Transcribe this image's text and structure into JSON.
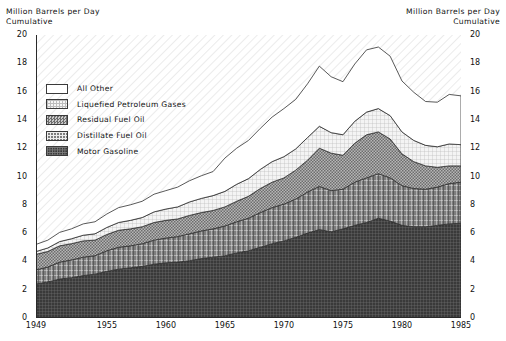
{
  "header": {
    "left": "Million Barrels per Day\nCumulative",
    "right": "Million Barrels per Day\nCumulative"
  },
  "legend": {
    "items": [
      {
        "label": "All Other",
        "swatch": "white",
        "color": "#ffffff"
      },
      {
        "label": "Liquefied Petroleum Gases",
        "swatch": "light-grid",
        "color": "#efefef"
      },
      {
        "label": "Residual Fuel Oil",
        "swatch": "medium-checker",
        "color": "#8f8f8f"
      },
      {
        "label": "Distillate Fuel Oil",
        "swatch": "dark-plaid",
        "color": "#5e5e5e"
      },
      {
        "label": "Motor Gasoline",
        "swatch": "darkest-plaid",
        "color": "#3c3c3c"
      }
    ]
  },
  "chart_data": {
    "type": "area",
    "stacked": true,
    "title": "Million Barrels per Day Cumulative",
    "xlabel": "",
    "ylabel": "Million Barrels per Day",
    "xlim": [
      1949,
      1985
    ],
    "ylim": [
      0,
      20
    ],
    "ytick_step": 2,
    "yticks": [
      0,
      2,
      4,
      6,
      8,
      10,
      12,
      14,
      16,
      18,
      20
    ],
    "xticks": [
      1949,
      1955,
      1960,
      1965,
      1970,
      1975,
      1980,
      1985
    ],
    "xtick_labels": [
      "1949",
      "1955",
      "1960",
      "1965",
      "1970",
      "1975",
      "1980",
      "1985"
    ],
    "minor_xticks": true,
    "grid": false,
    "legend_position": "upper-left-inside",
    "dual_y_axis": true,
    "x": [
      1949,
      1950,
      1951,
      1952,
      1953,
      1954,
      1955,
      1956,
      1957,
      1958,
      1959,
      1960,
      1961,
      1962,
      1963,
      1964,
      1965,
      1966,
      1967,
      1968,
      1969,
      1970,
      1971,
      1972,
      1973,
      1974,
      1975,
      1976,
      1977,
      1978,
      1979,
      1980,
      1981,
      1982,
      1983,
      1984,
      1985
    ],
    "series": [
      {
        "name": "Motor Gasoline",
        "color": "#3c3c3c",
        "values": [
          2.4,
          2.55,
          2.75,
          2.85,
          3.0,
          3.1,
          3.3,
          3.45,
          3.55,
          3.65,
          3.8,
          3.9,
          3.95,
          4.05,
          4.2,
          4.3,
          4.4,
          4.6,
          4.75,
          5.0,
          5.25,
          5.45,
          5.7,
          6.0,
          6.25,
          6.1,
          6.3,
          6.55,
          6.75,
          7.05,
          6.85,
          6.55,
          6.45,
          6.45,
          6.55,
          6.65,
          6.7
        ]
      },
      {
        "name": "Distillate Fuel Oil",
        "color": "#5e5e5e",
        "values": [
          1.0,
          1.05,
          1.2,
          1.25,
          1.3,
          1.3,
          1.45,
          1.55,
          1.55,
          1.6,
          1.7,
          1.75,
          1.8,
          1.9,
          1.95,
          2.0,
          2.1,
          2.2,
          2.3,
          2.45,
          2.55,
          2.6,
          2.7,
          2.9,
          3.05,
          2.9,
          2.8,
          3.05,
          3.15,
          3.15,
          3.05,
          2.8,
          2.7,
          2.65,
          2.7,
          2.85,
          2.9
        ]
      },
      {
        "name": "Residual Fuel Oil",
        "color": "#8f8f8f",
        "values": [
          1.1,
          1.1,
          1.15,
          1.15,
          1.15,
          1.1,
          1.15,
          1.2,
          1.2,
          1.2,
          1.25,
          1.25,
          1.25,
          1.3,
          1.3,
          1.3,
          1.35,
          1.45,
          1.55,
          1.7,
          1.8,
          1.85,
          2.05,
          2.25,
          2.7,
          2.65,
          2.4,
          2.75,
          3.05,
          2.95,
          2.75,
          2.25,
          1.9,
          1.65,
          1.4,
          1.25,
          1.15
        ]
      },
      {
        "name": "Liquefied Petroleum Gases",
        "color": "#efefef",
        "values": [
          0.2,
          0.25,
          0.3,
          0.35,
          0.4,
          0.45,
          0.5,
          0.55,
          0.6,
          0.65,
          0.75,
          0.8,
          0.85,
          0.95,
          1.0,
          1.05,
          1.1,
          1.2,
          1.25,
          1.35,
          1.45,
          1.5,
          1.5,
          1.6,
          1.55,
          1.45,
          1.45,
          1.55,
          1.6,
          1.65,
          1.65,
          1.55,
          1.5,
          1.45,
          1.45,
          1.55,
          1.5
        ]
      },
      {
        "name": "All Other",
        "color": "#ffffff",
        "values": [
          0.5,
          0.55,
          0.65,
          0.7,
          0.8,
          0.85,
          0.95,
          1.05,
          1.1,
          1.15,
          1.25,
          1.3,
          1.4,
          1.5,
          1.6,
          1.7,
          2.35,
          2.55,
          2.7,
          2.9,
          3.15,
          3.4,
          3.5,
          3.8,
          4.25,
          3.95,
          3.75,
          4.05,
          4.4,
          4.35,
          4.2,
          3.6,
          3.4,
          3.1,
          3.15,
          3.5,
          3.45
        ]
      }
    ],
    "totals": [
      5.2,
      5.5,
      6.05,
      6.3,
      6.65,
      6.8,
      7.35,
      7.8,
      8.0,
      8.25,
      8.75,
      9.0,
      9.25,
      9.7,
      10.05,
      10.35,
      11.3,
      12.0,
      12.55,
      13.4,
      14.2,
      14.8,
      15.45,
      16.55,
      17.8,
      17.05,
      16.7,
      17.95,
      18.95,
      19.15,
      18.5,
      16.75,
      15.95,
      15.3,
      15.25,
      15.8,
      15.75
    ]
  }
}
